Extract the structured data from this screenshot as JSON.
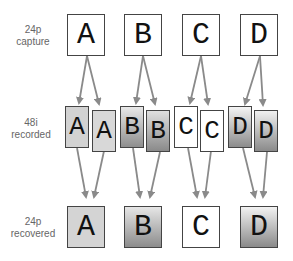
{
  "rows": {
    "capture": {
      "label_line1": "24p",
      "label_line2": "capture",
      "frames": [
        "A",
        "B",
        "C",
        "D"
      ]
    },
    "recorded": {
      "label_line1": "48i",
      "label_line2": "recorded",
      "fields": [
        "A",
        "A",
        "B",
        "B",
        "C",
        "C",
        "D",
        "D"
      ]
    },
    "recovered": {
      "label_line1": "24p",
      "label_line2": "recovered",
      "frames": [
        "A",
        "B",
        "C",
        "D"
      ]
    }
  },
  "colors": {
    "arrow": "#8a8a8a",
    "border": "#444444",
    "fill_A": "#d4d4d4",
    "fill_B_top": "#e6e6e6",
    "fill_B_bottom": "#8c8c8c",
    "fill_C": "#ffffff",
    "fill_D_top": "#f2f2f2",
    "fill_D_bottom": "#8a8a8a"
  }
}
